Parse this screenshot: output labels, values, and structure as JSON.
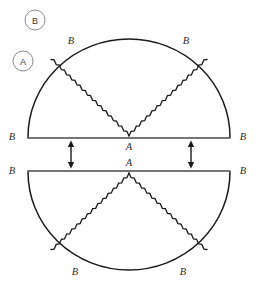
{
  "figure": {
    "background_color": "#ffffff",
    "ink_color": "#1a1a1a",
    "callouts": [
      {
        "id": "callout-b",
        "label": "B",
        "cx": 35,
        "cy": 20,
        "r": 10
      },
      {
        "id": "callout-a",
        "label": "A",
        "cx": 23,
        "cy": 61,
        "r": 10
      }
    ],
    "upper_half": {
      "name": "upper-semicircle",
      "center_x": 129,
      "center_y": 137,
      "radius_x": 101,
      "radius_y": 98,
      "orientation": "opens-upward",
      "apex_label": "A",
      "diameter_left_label": "B",
      "diameter_right_label": "B",
      "arc_left_label": "B",
      "arc_right_label": "B",
      "seam_angles_deg": [
        125,
        55
      ],
      "seam_style": "sawtooth"
    },
    "lower_half": {
      "name": "lower-semicircle",
      "center_x": 129,
      "center_y": 172,
      "radius_x": 101,
      "radius_y": 98,
      "orientation": "opens-downward",
      "apex_label": "A",
      "diameter_left_label": "B",
      "diameter_right_label": "B",
      "arc_left_label": "B",
      "arc_right_label": "B",
      "seam_angles_deg": [
        235,
        305
      ],
      "seam_style": "sawtooth"
    },
    "arrows": [
      {
        "id": "arrow-left",
        "x": 71,
        "y_top": 141,
        "y_bottom": 168,
        "style": "double-headed-vertical"
      },
      {
        "id": "arrow-right",
        "x": 191,
        "y_top": 141,
        "y_bottom": 168,
        "style": "double-headed-vertical"
      }
    ],
    "labels": {
      "upper_arc_left": {
        "text": "B",
        "x": 71,
        "y": 44
      },
      "upper_arc_right": {
        "text": "B",
        "x": 186,
        "y": 44
      },
      "upper_diameter_left": {
        "text": "B",
        "x": 12,
        "y": 140
      },
      "upper_diameter_right": {
        "text": "B",
        "x": 243,
        "y": 140
      },
      "upper_apex": {
        "text": "A",
        "x": 129,
        "y": 150
      },
      "lower_apex": {
        "text": "A",
        "x": 129,
        "y": 166
      },
      "lower_diameter_left": {
        "text": "B",
        "x": 12,
        "y": 174
      },
      "lower_diameter_right": {
        "text": "B",
        "x": 243,
        "y": 174
      },
      "lower_arc_left": {
        "text": "B",
        "x": 75,
        "y": 275
      },
      "lower_arc_right": {
        "text": "B",
        "x": 183,
        "y": 275
      }
    }
  }
}
